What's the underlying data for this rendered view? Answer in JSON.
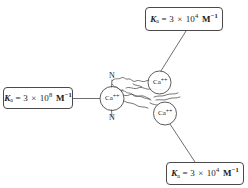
{
  "figure": {
    "background_color": "#ffffff",
    "line_color": "#4a4a4a",
    "text_color": "#1a1a1a"
  },
  "callouts": [
    {
      "id": "high-affinity",
      "k_symbol": "K",
      "k_subscript": "a",
      "equals": "=",
      "coefficient": "3",
      "times": "×",
      "base": "10",
      "exponent": "8",
      "unit": "M",
      "unit_exponent": "−1",
      "full_text": "Ka = 3 × 10⁸ M⁻¹"
    },
    {
      "id": "low-affinity-top",
      "k_symbol": "K",
      "k_subscript": "a",
      "equals": "=",
      "coefficient": "3",
      "times": "×",
      "base": "10",
      "exponent": "4",
      "unit": "M",
      "unit_exponent": "−1",
      "full_text": "Ka = 3 × 10⁴ M⁻¹"
    },
    {
      "id": "low-affinity-bottom",
      "k_symbol": "K",
      "k_subscript": "a",
      "equals": "=",
      "coefficient": "3",
      "times": "×",
      "base": "10",
      "exponent": "4",
      "unit": "M",
      "unit_exponent": "−1",
      "full_text": "Ka = 3 × 10⁴ M⁻¹"
    }
  ],
  "ions": [
    {
      "id": "ca-left",
      "element": "Ca",
      "charge": "++"
    },
    {
      "id": "ca-upper-right",
      "element": "Ca",
      "charge": "++"
    },
    {
      "id": "ca-lower-right",
      "element": "Ca",
      "charge": "++"
    }
  ],
  "atoms": [
    {
      "id": "nitrogen-top",
      "label": "N"
    },
    {
      "id": "nitrogen-bottom",
      "label": "N"
    }
  ]
}
